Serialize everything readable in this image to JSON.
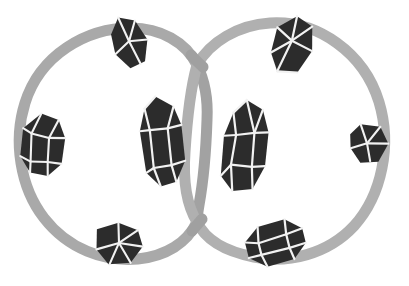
{
  "canvas": {
    "width": 409,
    "height": 286,
    "background_color": "#ffffff",
    "title": "Two interlocking gray rings studded with dark faceted crystals"
  },
  "palette": {
    "ring_gray": "#a9a9a9",
    "ring_gray_light": "#b5b5b5",
    "ring_gray_dark": "#9a9a9a",
    "crystal_dark": "#2c2c2c",
    "crystal_darker": "#232323",
    "crystal_mid": "#3a3a3a",
    "facet_light": "#f2f2f2",
    "facet_white": "#ffffff",
    "background": "#ffffff"
  },
  "rings": [
    {
      "name": "left-ring",
      "cx": 111,
      "cy": 144,
      "rx": 89,
      "ry": 116,
      "stroke_width": 11,
      "color": "#a9a9a9"
    },
    {
      "name": "right-ring",
      "cx": 290,
      "cy": 139,
      "rx": 95,
      "ry": 117,
      "stroke_width": 11,
      "color": "#b0b0b0"
    }
  ],
  "crossings": [
    {
      "name": "upper-crossing",
      "x": 197,
      "y": 65
    },
    {
      "name": "lower-crossing",
      "x": 197,
      "y": 222
    }
  ],
  "crystals": [
    {
      "id": "crystal-top-left",
      "label": "Top left crystal",
      "position": {
        "x": 130,
        "y": 41
      },
      "size": {
        "w": 36,
        "h": 52
      },
      "rotation": -18,
      "facet_count": 5,
      "on_ring": "left-ring"
    },
    {
      "id": "crystal-left",
      "label": "Left crystal",
      "position": {
        "x": 42,
        "y": 145
      },
      "size": {
        "w": 44,
        "h": 60
      },
      "rotation": 8,
      "facet_count": 6,
      "on_ring": "left-ring"
    },
    {
      "id": "crystal-bottom-left",
      "label": "Bottom left crystal",
      "position": {
        "x": 120,
        "y": 243
      },
      "size": {
        "w": 46,
        "h": 44
      },
      "rotation": 4,
      "facet_count": 5,
      "on_ring": "left-ring"
    },
    {
      "id": "crystal-center-left",
      "label": "Center left tall crystal",
      "position": {
        "x": 162,
        "y": 141
      },
      "size": {
        "w": 42,
        "h": 86
      },
      "rotation": -6,
      "facet_count": 7,
      "on_ring": "left-ring"
    },
    {
      "id": "crystal-center-right",
      "label": "Center right tall crystal",
      "position": {
        "x": 245,
        "y": 146
      },
      "size": {
        "w": 44,
        "h": 88
      },
      "rotation": 6,
      "facet_count": 8,
      "on_ring": "right-ring"
    },
    {
      "id": "crystal-top-right",
      "label": "Top right crystal",
      "position": {
        "x": 293,
        "y": 45
      },
      "size": {
        "w": 40,
        "h": 56
      },
      "rotation": 12,
      "facet_count": 5,
      "on_ring": "right-ring"
    },
    {
      "id": "crystal-right",
      "label": "Right crystal",
      "position": {
        "x": 369,
        "y": 143
      },
      "size": {
        "w": 38,
        "h": 40
      },
      "rotation": -10,
      "facet_count": 4,
      "on_ring": "right-ring"
    },
    {
      "id": "crystal-bottom-right",
      "label": "Bottom right crystal",
      "position": {
        "x": 276,
        "y": 243
      },
      "size": {
        "w": 56,
        "h": 44
      },
      "rotation": -14,
      "facet_count": 6,
      "on_ring": "right-ring"
    }
  ],
  "counts": {
    "rings": 2,
    "crystals": 8
  }
}
